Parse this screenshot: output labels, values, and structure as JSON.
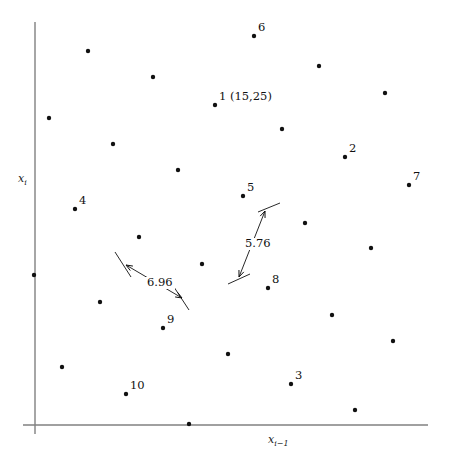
{
  "chart_data": {
    "type": "scatter",
    "title": "",
    "xlabel": "x_{i-1}",
    "ylabel": "x_i",
    "xlabel_base": "x",
    "xlabel_sub": "i−1",
    "ylabel_base": "x",
    "ylabel_sub": "i",
    "grid": false,
    "legend": "none",
    "axis_color": "#808080",
    "point_color": "#111111",
    "annotation_color": "#111111",
    "xlim": [
      0,
      451
    ],
    "ylim": [
      0,
      463
    ],
    "points": [
      {
        "id": "p1",
        "label": "1 (15,25)",
        "x": 215,
        "y": 105,
        "has_label": true
      },
      {
        "id": "p2",
        "label": "2",
        "x": 345,
        "y": 157,
        "has_label": true
      },
      {
        "id": "p3",
        "label": "3",
        "x": 291,
        "y": 384,
        "has_label": true
      },
      {
        "id": "p4",
        "label": "4",
        "x": 75,
        "y": 209,
        "has_label": true
      },
      {
        "id": "p5",
        "label": "5",
        "x": 243,
        "y": 196,
        "has_label": true
      },
      {
        "id": "p6",
        "label": "6",
        "x": 254,
        "y": 36,
        "has_label": true
      },
      {
        "id": "p7",
        "label": "7",
        "x": 409,
        "y": 185,
        "has_label": true
      },
      {
        "id": "p8",
        "label": "8",
        "x": 268,
        "y": 288,
        "has_label": true
      },
      {
        "id": "p9",
        "label": "9",
        "x": 163,
        "y": 328,
        "has_label": true
      },
      {
        "id": "p10",
        "label": "10",
        "x": 126,
        "y": 394,
        "has_label": true
      },
      {
        "id": "u1",
        "label": "",
        "x": 88,
        "y": 51,
        "has_label": false
      },
      {
        "id": "u2",
        "label": "",
        "x": 153,
        "y": 77,
        "has_label": false
      },
      {
        "id": "u3",
        "label": "",
        "x": 319,
        "y": 66,
        "has_label": false
      },
      {
        "id": "u4",
        "label": "",
        "x": 385,
        "y": 93,
        "has_label": false
      },
      {
        "id": "u5",
        "label": "",
        "x": 49,
        "y": 118,
        "has_label": false
      },
      {
        "id": "u6",
        "label": "",
        "x": 282,
        "y": 129,
        "has_label": false
      },
      {
        "id": "u7",
        "label": "",
        "x": 113,
        "y": 144,
        "has_label": false
      },
      {
        "id": "u8",
        "label": "",
        "x": 178,
        "y": 170,
        "has_label": false
      },
      {
        "id": "u9",
        "label": "",
        "x": 305,
        "y": 223,
        "has_label": false
      },
      {
        "id": "u10",
        "label": "",
        "x": 139,
        "y": 237,
        "has_label": false
      },
      {
        "id": "u11",
        "label": "",
        "x": 371,
        "y": 248,
        "has_label": false
      },
      {
        "id": "u12",
        "label": "",
        "x": 34,
        "y": 275,
        "has_label": false
      },
      {
        "id": "u13",
        "label": "",
        "x": 202,
        "y": 264,
        "has_label": false
      },
      {
        "id": "u14",
        "label": "",
        "x": 100,
        "y": 302,
        "has_label": false
      },
      {
        "id": "u15",
        "label": "",
        "x": 332,
        "y": 315,
        "has_label": false
      },
      {
        "id": "u16",
        "label": "",
        "x": 393,
        "y": 341,
        "has_label": false
      },
      {
        "id": "u17",
        "label": "",
        "x": 228,
        "y": 354,
        "has_label": false
      },
      {
        "id": "u18",
        "label": "",
        "x": 62,
        "y": 367,
        "has_label": false
      },
      {
        "id": "u19",
        "label": "",
        "x": 355,
        "y": 410,
        "has_label": false
      },
      {
        "id": "u20",
        "label": "",
        "x": 189,
        "y": 424,
        "has_label": false
      }
    ],
    "annotations": [
      {
        "id": "dim-696",
        "value": "6.96",
        "label_x": 145,
        "label_y": 277,
        "line": {
          "x1": 126,
          "y1": 265,
          "x2": 182,
          "y2": 298
        },
        "tick1": {
          "x1": 115,
          "y1": 252,
          "x2": 131,
          "y2": 277
        },
        "tick2": {
          "x1": 172,
          "y1": 284,
          "x2": 189,
          "y2": 310
        }
      },
      {
        "id": "dim-576",
        "value": "5.76",
        "label_x": 243,
        "label_y": 238,
        "line": {
          "x1": 265,
          "y1": 211,
          "x2": 239,
          "y2": 277
        },
        "tick1": {
          "x1": 258,
          "y1": 212,
          "x2": 280,
          "y2": 203
        },
        "tick2": {
          "x1": 228,
          "y1": 284,
          "x2": 250,
          "y2": 274
        }
      }
    ],
    "axes": {
      "y_axis": {
        "x": 35,
        "y_top": 22,
        "y_bottom": 434
      },
      "x_axis": {
        "y": 425,
        "x_left": 23,
        "x_right": 428
      }
    }
  }
}
